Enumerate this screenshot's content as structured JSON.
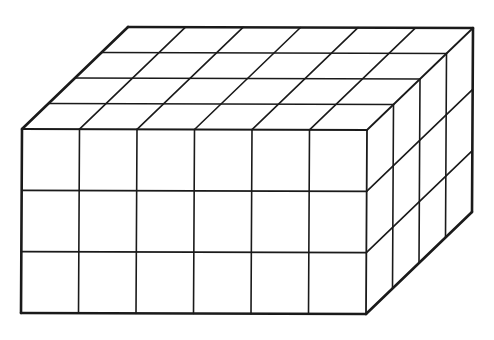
{
  "diagram": {
    "type": "isometric-unit-cube-prism",
    "dimensions": {
      "length": 6,
      "height": 3,
      "depth": 4
    },
    "colors": {
      "background": "#ffffff",
      "line": "#1a1a1a"
    },
    "geometry": {
      "front_top_left": [
        22,
        129
      ],
      "front_top_right": [
        367,
        130
      ],
      "front_bottom_left": [
        21,
        313
      ],
      "front_bottom_right": [
        366,
        314
      ],
      "depth_vector": [
        26.5,
        -25.5
      ]
    }
  }
}
